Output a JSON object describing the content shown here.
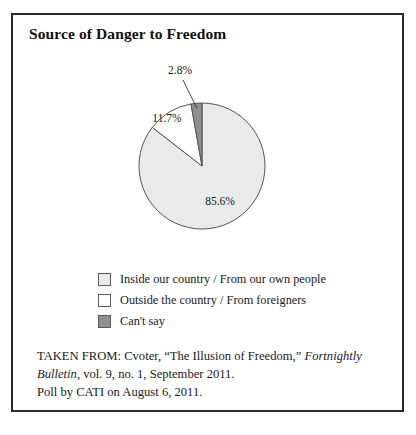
{
  "figure": {
    "title": "Source of Danger to Freedom",
    "frame_color": "#2b2b2b",
    "background": "#ffffff"
  },
  "chart_data": {
    "type": "pie",
    "title": "Source of Danger to Freedom",
    "xlabel": "",
    "ylabel": "",
    "categories": [
      "Inside our country / From our own people",
      "Outside the country / From foreigners",
      "Can't say"
    ],
    "values": [
      85.6,
      11.7,
      2.8
    ],
    "value_labels": [
      "85.6%",
      "11.7%",
      "2.8%"
    ],
    "unit": "percent",
    "colors": [
      "#eaeaea",
      "#ffffff",
      "#8f8f8f"
    ],
    "slice_border_color": "#555555",
    "start_angle_deg": 0,
    "direction": "clockwise",
    "legend_position": "bottom-left",
    "grid": false,
    "slices": [
      {
        "name": "Inside our country / From our own people",
        "value": 85.6,
        "label": "85.6%",
        "color": "#eaeaea",
        "label_placement": "inside"
      },
      {
        "name": "Outside the country / From foreigners",
        "value": 11.7,
        "label": "11.7%",
        "color": "#ffffff",
        "label_placement": "inside"
      },
      {
        "name": "Can't say",
        "value": 2.8,
        "label": "2.8%",
        "color": "#8f8f8f",
        "label_placement": "outside-with-leader"
      }
    ]
  },
  "legend": {
    "items": [
      {
        "label": "Inside our country / From our own people",
        "color": "#eaeaea"
      },
      {
        "label": "Outside the country / From foreigners",
        "color": "#ffffff"
      },
      {
        "label": "Can't say",
        "color": "#8f8f8f"
      }
    ]
  },
  "source": {
    "line1_prefix": "TAKEN FROM: Cvoter, “The Illusion of Freedom,” ",
    "line1_italic": "Fortnightly",
    "line2_italic": "Bulletin",
    "line2_rest": ", vol. 9, no. 1, September 2011.",
    "line3": "Poll by CATI on August 6, 2011."
  }
}
